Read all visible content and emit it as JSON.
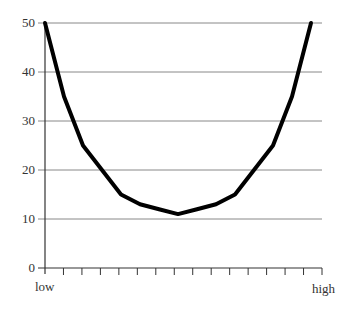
{
  "chart_data": {
    "type": "line",
    "title": "",
    "xlabel": "",
    "ylabel": "",
    "x_tick_labels": {
      "start": "low",
      "end": "high"
    },
    "y_ticks": [
      0,
      10,
      20,
      30,
      40,
      50
    ],
    "ylim": [
      0,
      50
    ],
    "grid": {
      "horizontal": true,
      "vertical": false
    },
    "x_minor_ticks": 15,
    "legend": null,
    "x": [
      0,
      1,
      2,
      3,
      4,
      5,
      6,
      7,
      8,
      9,
      10,
      11,
      12,
      13,
      14
    ],
    "series": [
      {
        "name": "curve",
        "values": [
          50,
          35,
          25,
          20,
          15,
          13,
          12,
          11,
          12,
          13,
          15,
          20,
          25,
          35,
          50
        ],
        "color": "#000000"
      }
    ]
  },
  "axis": {
    "y_labels": [
      "50",
      "40",
      "30",
      "20",
      "10",
      "0"
    ],
    "x_low": "low",
    "x_high": "high"
  }
}
